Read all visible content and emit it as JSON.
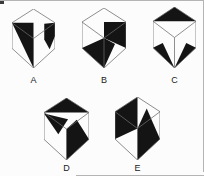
{
  "figure": {
    "background": "#fcfcfc",
    "line_color": "#6a6a6a",
    "fill_color": "#141414",
    "label_color": "#222222",
    "geometry": {
      "viewbox": "0 0 88 120",
      "hexagon": [
        [
          44,
          0
        ],
        [
          88,
          28
        ],
        [
          88,
          80
        ],
        [
          44,
          120
        ],
        [
          0,
          80
        ],
        [
          0,
          28
        ]
      ],
      "internal_edges": [
        [
          [
            0,
            28
          ],
          [
            44,
            60
          ]
        ],
        [
          [
            88,
            28
          ],
          [
            44,
            60
          ]
        ],
        [
          [
            44,
            60
          ],
          [
            44,
            120
          ]
        ]
      ]
    },
    "options": [
      {
        "label": "A",
        "box": {
          "left": 12,
          "top": 9,
          "width": 43,
          "height": 59
        },
        "label_box": {
          "left": 12,
          "top": 76,
          "width": 43
        },
        "black_shapes": [
          [
            [
              0,
              28
            ],
            [
              44,
              28
            ],
            [
              44,
              120
            ]
          ],
          [
            [
              66,
              30
            ],
            [
              88,
              28
            ],
            [
              88,
              55
            ],
            [
              77,
              82
            ],
            [
              66,
              62
            ]
          ]
        ]
      },
      {
        "label": "B",
        "box": {
          "left": 82,
          "top": 8,
          "width": 44,
          "height": 60
        },
        "label_box": {
          "left": 82,
          "top": 76,
          "width": 44
        },
        "black_shapes": [
          [
            [
              44,
              28
            ],
            [
              88,
              28
            ],
            [
              88,
              80
            ],
            [
              44,
              60
            ]
          ],
          [
            [
              44,
              60
            ],
            [
              66,
              72
            ],
            [
              44,
              120
            ],
            [
              0,
              80
            ]
          ]
        ]
      },
      {
        "label": "C",
        "box": {
          "left": 153,
          "top": 7,
          "width": 43,
          "height": 61
        },
        "label_box": {
          "left": 153,
          "top": 76,
          "width": 43
        },
        "black_shapes": [
          [
            [
              44,
              0
            ],
            [
              0,
              28
            ],
            [
              88,
              28
            ]
          ],
          [
            [
              20,
              71
            ],
            [
              0,
              80
            ],
            [
              44,
              120
            ]
          ],
          [
            [
              68,
              71
            ],
            [
              88,
              80
            ],
            [
              44,
              120
            ]
          ]
        ]
      },
      {
        "label": "D",
        "box": {
          "left": 44,
          "top": 98,
          "width": 45,
          "height": 62
        },
        "label_box": {
          "left": 44,
          "top": 164,
          "width": 45
        },
        "black_shapes": [
          [
            [
              44,
              0
            ],
            [
              0,
              28
            ],
            [
              88,
              28
            ]
          ],
          [
            [
              0,
              30
            ],
            [
              47,
              41
            ],
            [
              28,
              70
            ]
          ],
          [
            [
              64,
              42
            ],
            [
              88,
              80
            ],
            [
              44,
              120
            ],
            [
              44,
              60
            ]
          ]
        ]
      },
      {
        "label": "E",
        "box": {
          "left": 115,
          "top": 97,
          "width": 45,
          "height": 63
        },
        "label_box": {
          "left": 115,
          "top": 164,
          "width": 45
        },
        "black_shapes": [
          [
            [
              44,
              0
            ],
            [
              44,
              60
            ],
            [
              0,
              80
            ],
            [
              0,
              28
            ]
          ],
          [
            [
              62,
              22
            ],
            [
              88,
              80
            ],
            [
              44,
              120
            ],
            [
              44,
              60
            ]
          ]
        ]
      }
    ]
  },
  "page": {
    "borders": {
      "top": {
        "left": 0,
        "top": 0,
        "width": 204,
        "height": 1
      },
      "right": {
        "left": 203,
        "top": 0,
        "width": 1,
        "height": 172
      },
      "bottom": {
        "left": 76,
        "top": 175,
        "width": 128,
        "height": 1
      }
    }
  }
}
